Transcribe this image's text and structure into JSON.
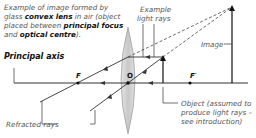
{
  "caption": {
    "part1": "Example of image formed by glass ",
    "bold1": "convex lens",
    "part2": " in air (object placed between ",
    "bold2": "principal focus",
    "part3": " and ",
    "bold3": "optical centre",
    "part4": ")."
  },
  "labels": {
    "principal_axis": "Principal axis",
    "example_light_rays_1": "Example",
    "example_light_rays_2": "light rays",
    "image": "Image",
    "object_1": "Object (assumed to",
    "object_2": "produce light rays –",
    "object_3": "see introduction)",
    "refracted_rays": "Refracted rays"
  },
  "points": {
    "focus_left": "F",
    "focus_right": "F′",
    "optical_centre": "O"
  },
  "colors": {
    "line": "#333333",
    "lens_fill": "#d4d4d4",
    "lens_edge": "#888888",
    "text": "#555555"
  }
}
